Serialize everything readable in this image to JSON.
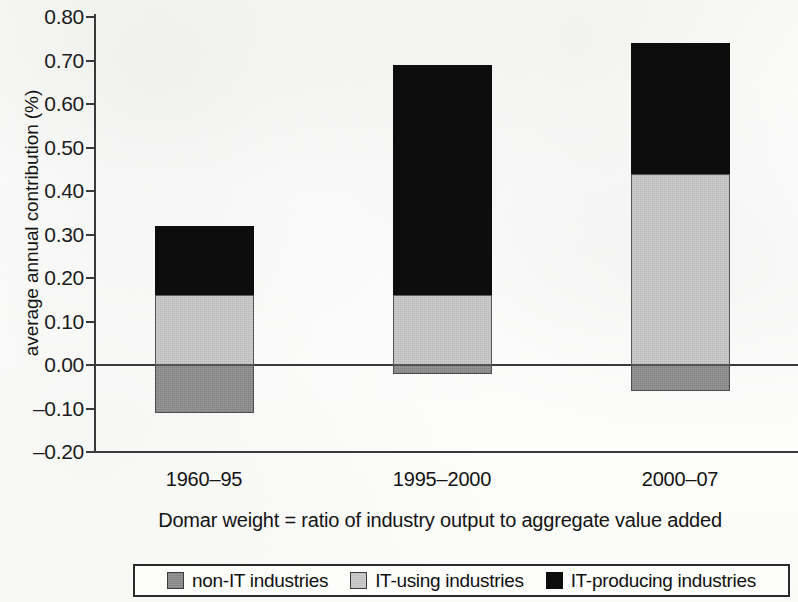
{
  "chart_data": {
    "type": "bar",
    "subtype": "stacked",
    "title": "",
    "xlabel": "Domar weight = ratio of industry output to aggregate value added",
    "ylabel": "average annual contribution (%)",
    "categories": [
      "1960–95",
      "1995–2000",
      "2000–07"
    ],
    "series": [
      {
        "name": "non-IT industries",
        "color": "#8f8f8f",
        "values": [
          -0.11,
          -0.02,
          -0.06
        ]
      },
      {
        "name": "IT-using industries",
        "color": "#cacaca",
        "values": [
          0.16,
          0.16,
          0.44
        ]
      },
      {
        "name": "IT-producing industries",
        "color": "#0d0d0d",
        "values": [
          0.16,
          0.53,
          0.3
        ]
      }
    ],
    "totals_positive": [
      0.32,
      0.69,
      0.74
    ],
    "ylim": [
      -0.2,
      0.8
    ],
    "ytick_labels": [
      "0.80",
      "0.70",
      "0.60",
      "0.50",
      "0.40",
      "0.30",
      "0.20",
      "0.10",
      "0.00",
      "–0.10",
      "–0.20"
    ],
    "ytick_values": [
      0.8,
      0.7,
      0.6,
      0.5,
      0.4,
      0.3,
      0.2,
      0.1,
      0.0,
      -0.1,
      -0.2
    ],
    "grid": false,
    "zero_line": true,
    "legend_position": "bottom"
  },
  "axis": {
    "y_title": "average annual contribution (%)",
    "x_caption": "Domar weight = ratio of industry output to aggregate value added"
  },
  "legend": {
    "items": [
      {
        "label": "non-IT industries",
        "swatch": "dark"
      },
      {
        "label": "IT-using industries",
        "swatch": "light"
      },
      {
        "label": "IT-producing industries",
        "swatch": "black"
      }
    ]
  }
}
